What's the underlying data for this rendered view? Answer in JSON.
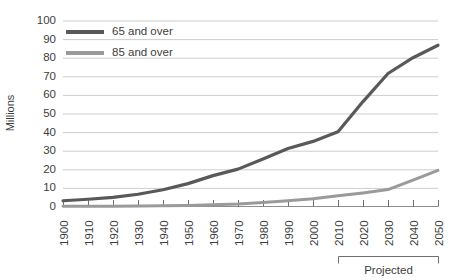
{
  "chart_data": {
    "type": "line",
    "title": "",
    "xlabel": "",
    "ylabel": "Millions",
    "ylim": [
      0,
      100
    ],
    "ytick_step": 10,
    "yticks": [
      0,
      10,
      20,
      30,
      40,
      50,
      60,
      70,
      80,
      90,
      100
    ],
    "grid": true,
    "legend_position": "top-left-inside",
    "x": [
      1900,
      1910,
      1920,
      1930,
      1940,
      1950,
      1960,
      1970,
      1980,
      1990,
      2000,
      2010,
      2020,
      2030,
      2040,
      2050
    ],
    "categories": [
      "1900",
      "1910",
      "1920",
      "1930",
      "1940",
      "1950",
      "1960",
      "1970",
      "1980",
      "1990",
      "2000",
      "2010",
      "2020",
      "2030",
      "2040",
      "2050"
    ],
    "series": [
      {
        "name": "65 and over",
        "color": "#595959",
        "values": [
          3.1,
          3.9,
          4.9,
          6.6,
          9.0,
          12.3,
          16.6,
          20.1,
          25.5,
          31.2,
          35.0,
          40.2,
          56.4,
          71.5,
          80.0,
          86.7
        ]
      },
      {
        "name": "85 and over",
        "color": "#9a9a9a",
        "values": [
          0.1,
          0.2,
          0.2,
          0.3,
          0.4,
          0.6,
          0.9,
          1.4,
          2.2,
          3.1,
          4.2,
          5.8,
          7.3,
          9.1,
          14.2,
          19.4
        ]
      }
    ],
    "annotations": [
      {
        "name": "projected-bracket",
        "label": "Projected",
        "from_x": 2010,
        "to_x": 2050
      }
    ]
  },
  "legend": {
    "items": [
      {
        "label": "65 and over",
        "color": "#595959"
      },
      {
        "label": "85 and over",
        "color": "#9a9a9a"
      }
    ]
  },
  "axes": {
    "y_title": "Millions"
  }
}
